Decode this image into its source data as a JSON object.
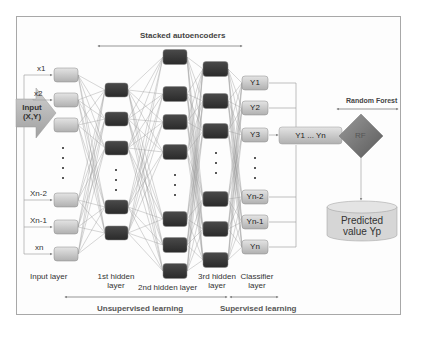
{
  "title": "Stacked autoencoders",
  "input": {
    "label_line1": "Input",
    "label_line2": "(X,Y)"
  },
  "inputs": [
    "x1",
    "x2",
    "Xn-2",
    "Xn-1",
    "xn"
  ],
  "classifier_nodes": [
    "Y1",
    "Y2",
    "Y3",
    "Yn-2",
    "Yn-1",
    "Yn"
  ],
  "aggregate": {
    "label": "Y1 ... Yn"
  },
  "random_forest": {
    "title": "Random Forest",
    "node": "RF"
  },
  "output": {
    "line1": "Predicted",
    "line2": "value Yp"
  },
  "layers": {
    "input": "Input layer",
    "hidden1_line1": "1st hidden",
    "hidden1_line2": "layer",
    "hidden2": "2nd hidden layer",
    "hidden3_line1": "3rd hidden",
    "hidden3_line2": "layer",
    "classifier_line1": "Classifier",
    "classifier_line2": "layer"
  },
  "learning": {
    "unsupervised": "Unsupervised learning",
    "supervised": "Supervised learning"
  },
  "colors": {
    "input_node": "#c8c8c8",
    "hidden_node": "#3a3a3a",
    "classifier_node": "#cfcfcf",
    "rf": "#7a7a7a",
    "cylinder": "#d4d4d4",
    "edge": "#9a9a9a"
  }
}
